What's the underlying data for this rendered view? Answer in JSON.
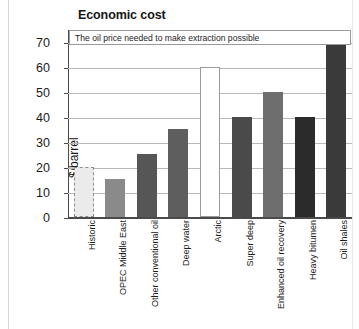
{
  "chart_data": {
    "type": "bar",
    "title": "Economic cost",
    "subtitle": "The oil price needed to make extraction possible",
    "xlabel": "",
    "ylabel": "$/barrel",
    "ylim": [
      0,
      75
    ],
    "yticks": [
      0,
      10,
      20,
      30,
      40,
      50,
      60,
      70
    ],
    "grid": true,
    "legend": "none",
    "categories": [
      "Historic",
      "OPEC Middle East",
      "Other conventional oil",
      "Deep water",
      "Arctic",
      "Super deep",
      "Enhanced oil recovery",
      "Heavy bitumen",
      "Oil shales"
    ],
    "values": [
      20,
      15,
      25,
      35,
      60,
      40,
      50,
      40,
      70
    ],
    "bar_styles": [
      {
        "fill": "#ebebeb",
        "border": "#8d8d8d",
        "border_style": "dashed"
      },
      {
        "fill": "#8a8a8a",
        "border": "#8a8a8a",
        "border_style": "solid"
      },
      {
        "fill": "#565656",
        "border": "#565656",
        "border_style": "solid"
      },
      {
        "fill": "#5e5e5e",
        "border": "#5e5e5e",
        "border_style": "solid"
      },
      {
        "fill": "#ffffff",
        "border": "#9a9a9a",
        "border_style": "solid"
      },
      {
        "fill": "#4a4a4a",
        "border": "#4a4a4a",
        "border_style": "solid"
      },
      {
        "fill": "#6e6e6e",
        "border": "#6e6e6e",
        "border_style": "solid"
      },
      {
        "fill": "#2b2b2b",
        "border": "#2b2b2b",
        "border_style": "solid"
      },
      {
        "fill": "#3a3a3a",
        "border": "#3a3a3a",
        "border_style": "solid"
      }
    ]
  },
  "axis": {
    "tick_labels": [
      "70",
      "60",
      "50",
      "40",
      "30",
      "20",
      "10",
      "0"
    ]
  },
  "colors": {
    "axis": "#4a4a4a",
    "grid": "#b9b9b9",
    "text": "#1b1b1b",
    "background": "#ffffff"
  }
}
